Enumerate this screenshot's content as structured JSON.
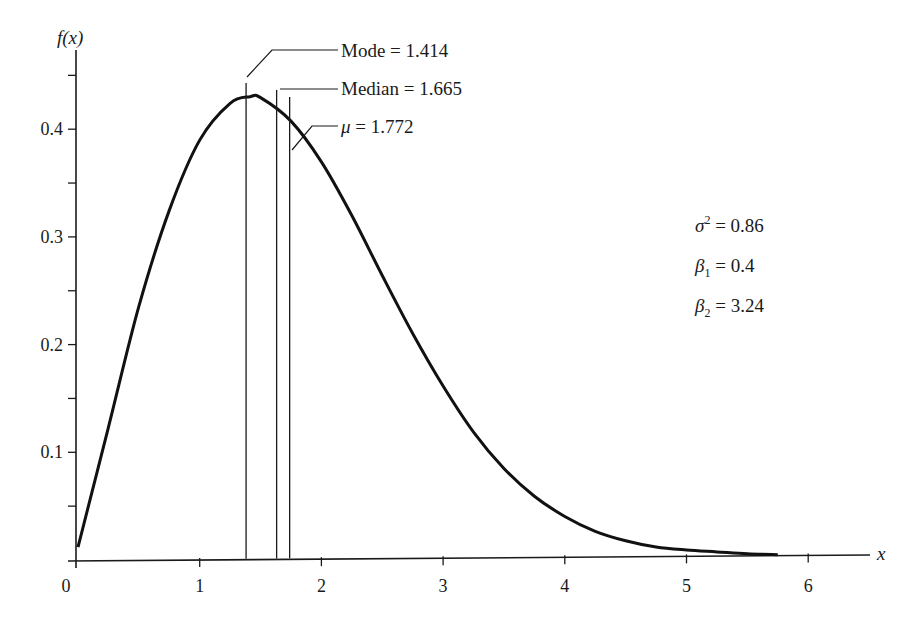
{
  "chart_data": {
    "type": "line",
    "title": "",
    "xlabel": "x",
    "ylabel": "f(x)",
    "xlim": [
      0,
      6.5
    ],
    "ylim": [
      0,
      0.48
    ],
    "x_ticks": [
      0,
      1,
      2,
      3,
      4,
      5,
      6
    ],
    "x_tick_labels": [
      "0",
      "1",
      "2",
      "3",
      "4",
      "5",
      "6"
    ],
    "y_ticks": [
      0.05,
      0.1,
      0.15,
      0.2,
      0.25,
      0.3,
      0.35,
      0.4,
      0.45
    ],
    "y_tick_labels": [
      "",
      "0.1",
      "",
      "0.2",
      "",
      "0.3",
      "",
      "0.4",
      ""
    ],
    "grid": false,
    "legend": null,
    "series": [
      {
        "name": "f(x)",
        "x": [
          0,
          0.25,
          0.5,
          0.75,
          1.0,
          1.25,
          1.414,
          1.5,
          1.75,
          2.0,
          2.25,
          2.5,
          2.75,
          3.0,
          3.25,
          3.5,
          3.75,
          4.0,
          4.25,
          4.5,
          4.75,
          5.0,
          5.25,
          5.5,
          5.75
        ],
        "values": [
          0.012,
          0.123,
          0.235,
          0.324,
          0.389,
          0.423,
          0.429,
          0.428,
          0.406,
          0.368,
          0.318,
          0.262,
          0.208,
          0.159,
          0.116,
          0.082,
          0.056,
          0.037,
          0.023,
          0.014,
          0.008,
          0.005,
          0.003,
          0.001,
          0.0
        ]
      }
    ],
    "markers": [
      {
        "name": "Mode",
        "x": 1.414,
        "label": "Mode = 1.414"
      },
      {
        "name": "Median",
        "x": 1.665,
        "label": "Median = 1.665"
      },
      {
        "name": "Mean",
        "x": 1.772,
        "label": "μ = 1.772"
      }
    ],
    "annotations": [
      {
        "text": "σ² = 0.86",
        "symbol": "σ",
        "sup": "2",
        "value": "0.86"
      },
      {
        "text": "β₁ = 0.4",
        "symbol": "β",
        "sub": "1",
        "value": "0.4"
      },
      {
        "text": "β₂ = 3.24",
        "symbol": "β",
        "sub": "2",
        "value": "3.24"
      }
    ]
  },
  "labels": {
    "y_axis": "f(x)",
    "x_axis": "x",
    "mode": "Mode = 1.414",
    "median": "Median = 1.665",
    "mean_symbol": "μ",
    "mean_value": " = 1.772",
    "sigma_symbol": "σ",
    "sigma_sup": "2",
    "sigma_value": " = 0.86",
    "beta1_symbol": "β",
    "beta1_sub": "1",
    "beta1_value": " = 0.4",
    "beta2_symbol": "β",
    "beta2_sub": "2",
    "beta2_value": " = 3.24"
  }
}
